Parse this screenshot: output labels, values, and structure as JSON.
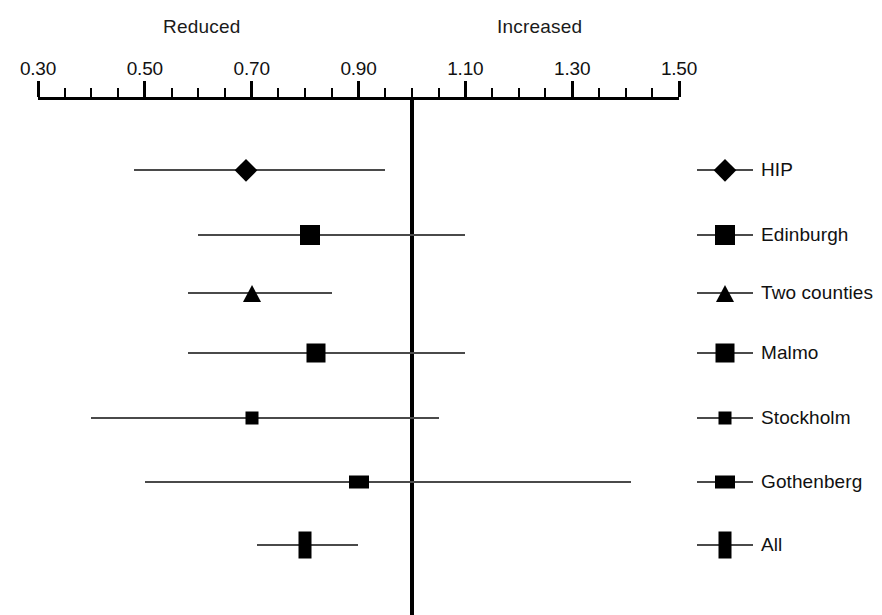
{
  "chart_data": {
    "type": "forest",
    "title": "",
    "xlabel": "",
    "ylabel": "",
    "xlim": [
      0.3,
      1.5
    ],
    "grid": false,
    "null_value": 1.0,
    "legend_position": "right",
    "direction_labels": {
      "left": "Reduced",
      "right": "Increased"
    },
    "axis": {
      "major_ticks": [
        0.3,
        0.5,
        0.7,
        0.9,
        1.1,
        1.3,
        1.5
      ],
      "major_tick_labels": [
        "0.30",
        "0.50",
        "0.70",
        "0.90",
        "1.10",
        "1.30",
        "1.50"
      ],
      "minor_tick_step": 0.05
    },
    "categories": [
      "HIP",
      "Edinburgh",
      "Two counties",
      "Malmo",
      "Stockholm",
      "Gothenberg",
      "All"
    ],
    "values": [
      0.69,
      0.81,
      0.7,
      0.82,
      0.7,
      0.9,
      0.8
    ],
    "ci_low": [
      0.48,
      0.6,
      0.58,
      0.58,
      0.4,
      0.5,
      0.71
    ],
    "ci_high": [
      0.95,
      1.1,
      0.85,
      1.1,
      1.05,
      1.41,
      0.9
    ],
    "markers": [
      "diamond",
      "square",
      "triangle",
      "square",
      "square",
      "rect-wide",
      "rect-tall"
    ],
    "points": [
      {
        "label": "HIP",
        "value": 0.69,
        "ci_low": 0.48,
        "ci_high": 0.95,
        "marker": "diamond",
        "marker_w": 22,
        "marker_h": 22
      },
      {
        "label": "Edinburgh",
        "value": 0.81,
        "ci_low": 0.6,
        "ci_high": 1.1,
        "marker": "square",
        "marker_w": 20,
        "marker_h": 20
      },
      {
        "label": "Two counties",
        "value": 0.7,
        "ci_low": 0.58,
        "ci_high": 0.85,
        "marker": "triangle",
        "marker_w": 19,
        "marker_h": 17
      },
      {
        "label": "Malmo",
        "value": 0.82,
        "ci_low": 0.58,
        "ci_high": 1.1,
        "marker": "square",
        "marker_w": 19,
        "marker_h": 19
      },
      {
        "label": "Stockholm",
        "value": 0.7,
        "ci_low": 0.4,
        "ci_high": 1.05,
        "marker": "square",
        "marker_w": 13,
        "marker_h": 13
      },
      {
        "label": "Gothenberg",
        "value": 0.9,
        "ci_low": 0.5,
        "ci_high": 1.41,
        "marker": "rect-wide",
        "marker_w": 20,
        "marker_h": 13
      },
      {
        "label": "All",
        "value": 0.8,
        "ci_low": 0.71,
        "ci_high": 0.9,
        "marker": "rect-tall",
        "marker_w": 13,
        "marker_h": 27
      }
    ]
  },
  "legend": {
    "items": [
      {
        "label": "HIP",
        "marker": "diamond",
        "marker_w": 22,
        "marker_h": 22
      },
      {
        "label": "Edinburgh",
        "marker": "square",
        "marker_w": 20,
        "marker_h": 20
      },
      {
        "label": "Two counties",
        "marker": "triangle",
        "marker_w": 19,
        "marker_h": 17
      },
      {
        "label": "Malmo",
        "marker": "square",
        "marker_w": 19,
        "marker_h": 19
      },
      {
        "label": "Stockholm",
        "marker": "square",
        "marker_w": 13,
        "marker_h": 13
      },
      {
        "label": "Gothenberg",
        "marker": "rect-wide",
        "marker_w": 20,
        "marker_h": 13
      },
      {
        "label": "All",
        "marker": "rect-tall",
        "marker_w": 13,
        "marker_h": 27
      }
    ]
  },
  "colors": {
    "axis": "#000000",
    "marker": "#000000",
    "ci": "#4a4a4a",
    "text": "#111111",
    "background": "#ffffff"
  }
}
